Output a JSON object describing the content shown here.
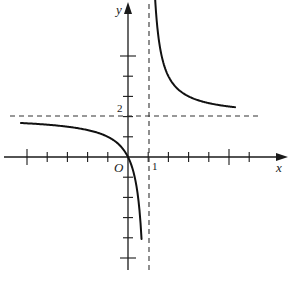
{
  "chart_data": {
    "type": "line",
    "title": "",
    "function": "y = 2x/(x-1)",
    "xlabel": "x",
    "ylabel": "y",
    "origin_label": "O",
    "tick_labels": {
      "x": [
        "1"
      ],
      "y": [
        "2"
      ]
    },
    "xlim": [
      -5.5,
      6.5
    ],
    "ylim": [
      -5.5,
      7.5
    ],
    "grid": false,
    "legend": null,
    "asymptotes": [
      {
        "type": "vertical",
        "x": 1,
        "style": "dashed"
      },
      {
        "type": "horizontal",
        "y": 2,
        "style": "dashed"
      }
    ],
    "x_ticks": [
      -5,
      -4,
      -3,
      -2,
      -1,
      1,
      2,
      3,
      4,
      5,
      6
    ],
    "y_ticks": [
      -5,
      -4,
      -3,
      -2,
      -1,
      1,
      2,
      3,
      4,
      5
    ],
    "series": [
      {
        "name": "left branch",
        "x": [
          -5.3,
          -4,
          -3,
          -2,
          -1,
          -0.5,
          0,
          0.3,
          0.5,
          0.67
        ],
        "y": [
          1.68,
          1.6,
          1.5,
          1.33,
          1.0,
          0.67,
          0.0,
          -0.86,
          -2.0,
          -4.06
        ]
      },
      {
        "name": "right branch",
        "x": [
          1.3,
          1.5,
          2,
          2.5,
          3,
          4,
          5,
          5.3
        ],
        "y": [
          8.67,
          6.0,
          4.0,
          3.33,
          3.0,
          2.67,
          2.5,
          2.47
        ]
      }
    ]
  },
  "labels": {
    "x_axis": "x",
    "y_axis": "y",
    "origin": "O",
    "x_one": "1",
    "y_two": "2"
  },
  "caption": ""
}
